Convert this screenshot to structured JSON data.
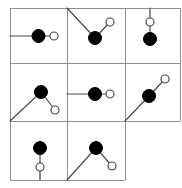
{
  "canvas": {
    "width": 182,
    "height": 188,
    "background": "#ffffff",
    "title": "grid-of-node-link-diagrams"
  },
  "style": {
    "grid_line_color": "#8f8f8f",
    "grid_line_width": 1,
    "link_color": "#4a4a4a",
    "link_width": 1.2,
    "filled_node_fill": "#000000",
    "filled_node_stroke": "#000000",
    "filled_node_radius": 6.5,
    "open_node_fill": "#ffffff",
    "open_node_stroke": "#4a4a4a",
    "open_node_stroke_width": 1.2,
    "open_node_radius": 4
  },
  "grid": {
    "origin_x": 10,
    "origin_y": 8,
    "col_edges": [
      10,
      67,
      125,
      180
    ],
    "row_edges": [
      8,
      63,
      121,
      180
    ],
    "rows": 3,
    "cols": 3,
    "missing_cells": [
      "r2c2"
    ],
    "lines": [
      {
        "name": "outer-top",
        "x1": 10,
        "y1": 8,
        "x2": 180,
        "y2": 8
      },
      {
        "name": "outer-left",
        "x1": 10,
        "y1": 8,
        "x2": 10,
        "y2": 180
      },
      {
        "name": "outer-right-top",
        "x1": 180,
        "y1": 8,
        "x2": 180,
        "y2": 121
      },
      {
        "name": "row1-divider",
        "x1": 10,
        "y1": 63,
        "x2": 180,
        "y2": 63
      },
      {
        "name": "row2-divider",
        "x1": 10,
        "y1": 121,
        "x2": 180,
        "y2": 121
      },
      {
        "name": "col1-divider",
        "x1": 67,
        "y1": 8,
        "x2": 67,
        "y2": 180
      },
      {
        "name": "col2-divider",
        "x1": 125,
        "y1": 8,
        "x2": 125,
        "y2": 180
      },
      {
        "name": "outer-bottom",
        "x1": 10,
        "y1": 180,
        "x2": 125,
        "y2": 180
      }
    ]
  },
  "cells": [
    {
      "id": "r0c0",
      "row": 0,
      "col": 0,
      "pattern": "horizontal-left-edge",
      "links": [
        {
          "name": "link-edge-to-filled",
          "x1": 10,
          "y1": 36,
          "x2": 38.5,
          "y2": 36
        },
        {
          "name": "link-filled-to-open",
          "x1": 38.5,
          "y1": 36,
          "x2": 54,
          "y2": 36
        }
      ],
      "filled_node": {
        "cx": 38.5,
        "cy": 36
      },
      "open_node": {
        "cx": 54,
        "cy": 36
      }
    },
    {
      "id": "r0c1",
      "row": 0,
      "col": 1,
      "pattern": "vee-from-top-left-corner",
      "links": [
        {
          "name": "link-corner-to-filled",
          "x1": 67,
          "y1": 8,
          "x2": 95,
          "y2": 38
        },
        {
          "name": "link-filled-to-open",
          "x1": 95,
          "y1": 38,
          "x2": 110,
          "y2": 22
        }
      ],
      "filled_node": {
        "cx": 95,
        "cy": 38
      },
      "open_node": {
        "cx": 110,
        "cy": 22
      }
    },
    {
      "id": "r0c2",
      "row": 0,
      "col": 2,
      "pattern": "vertical-from-top-edge",
      "links": [
        {
          "name": "link-edge-to-open",
          "x1": 150,
          "y1": 8,
          "x2": 150,
          "y2": 22
        },
        {
          "name": "link-open-to-filled",
          "x1": 150,
          "y1": 22,
          "x2": 150,
          "y2": 39
        }
      ],
      "open_node": {
        "cx": 150,
        "cy": 22
      },
      "filled_node": {
        "cx": 150,
        "cy": 39
      }
    },
    {
      "id": "r1c0",
      "row": 1,
      "col": 0,
      "pattern": "lambda-from-bottom-left-corner",
      "links": [
        {
          "name": "link-corner-to-filled",
          "x1": 10,
          "y1": 121,
          "x2": 41,
          "y2": 92
        },
        {
          "name": "link-filled-to-open",
          "x1": 41,
          "y1": 92,
          "x2": 55,
          "y2": 110
        }
      ],
      "filled_node": {
        "cx": 41,
        "cy": 92
      },
      "open_node": {
        "cx": 55,
        "cy": 110
      }
    },
    {
      "id": "r1c1",
      "row": 1,
      "col": 1,
      "pattern": "horizontal-left-edge",
      "links": [
        {
          "name": "link-edge-to-filled",
          "x1": 67,
          "y1": 94,
          "x2": 95,
          "y2": 94
        },
        {
          "name": "link-filled-to-open",
          "x1": 95,
          "y1": 94,
          "x2": 110,
          "y2": 94
        }
      ],
      "filled_node": {
        "cx": 95,
        "cy": 94
      },
      "open_node": {
        "cx": 110,
        "cy": 94
      }
    },
    {
      "id": "r1c2",
      "row": 1,
      "col": 2,
      "pattern": "vee-from-top-left-corner",
      "links": [
        {
          "name": "link-corner-to-filled",
          "x1": 125,
          "y1": 121,
          "x2": 149,
          "y2": 96
        },
        {
          "name": "link-filled-to-open",
          "x1": 149,
          "y1": 96,
          "x2": 165,
          "y2": 79
        }
      ],
      "filled_node": {
        "cx": 149,
        "cy": 96
      },
      "open_node": {
        "cx": 165,
        "cy": 79
      }
    },
    {
      "id": "r2c0",
      "row": 2,
      "col": 0,
      "pattern": "vertical-to-bottom-edge",
      "links": [
        {
          "name": "link-filled-to-open",
          "x1": 40,
          "y1": 148,
          "x2": 40,
          "y2": 167
        },
        {
          "name": "link-open-to-edge",
          "x1": 40,
          "y1": 167,
          "x2": 40,
          "y2": 180
        }
      ],
      "filled_node": {
        "cx": 40,
        "cy": 148
      },
      "open_node": {
        "cx": 40,
        "cy": 167
      }
    },
    {
      "id": "r2c1",
      "row": 2,
      "col": 1,
      "pattern": "lambda-from-bottom-left-corner",
      "links": [
        {
          "name": "link-corner-to-filled",
          "x1": 67,
          "y1": 180,
          "x2": 96,
          "y2": 148
        },
        {
          "name": "link-filled-to-open",
          "x1": 96,
          "y1": 148,
          "x2": 112,
          "y2": 166
        }
      ],
      "filled_node": {
        "cx": 96,
        "cy": 148
      },
      "open_node": {
        "cx": 112,
        "cy": 166
      }
    }
  ]
}
